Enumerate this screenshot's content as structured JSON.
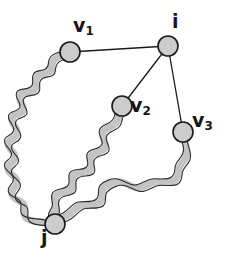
{
  "figure": {
    "background_color": "#ffffff"
  },
  "style": {
    "node_fill": "#cccccc",
    "node_stroke": "#1a1a1a",
    "node_radius": 10,
    "edge_color": "#1a1a1a",
    "edge_width": 1.3,
    "path_fill": "#c4c4c4",
    "path_stroke": "#3a3a3a",
    "path_width": 7
  },
  "nodes": [
    {
      "id": "v1",
      "label": "v",
      "subscript": "1",
      "x": 70,
      "y": 52
    },
    {
      "id": "i",
      "label": "i",
      "subscript": "",
      "x": 168,
      "y": 46
    },
    {
      "id": "v2",
      "label": "v",
      "subscript": "2",
      "x": 122,
      "y": 106
    },
    {
      "id": "v3",
      "label": "v",
      "subscript": "3",
      "x": 183,
      "y": 132
    },
    {
      "id": "j",
      "label": "j",
      "subscript": "",
      "x": 55,
      "y": 224
    }
  ],
  "edges": [
    {
      "from": "i",
      "to": "v1"
    },
    {
      "from": "i",
      "to": "v2"
    },
    {
      "from": "i",
      "to": "v3"
    }
  ],
  "wavy_paths": [
    {
      "id": "path-v1-j",
      "from": "v1",
      "to": "j"
    },
    {
      "id": "path-v2-j",
      "from": "v2",
      "to": "j"
    },
    {
      "id": "path-v3-j",
      "from": "v3",
      "to": "j"
    }
  ],
  "labels": {
    "v1": "v",
    "v1_sub": "1",
    "v2": "v",
    "v2_sub": "2",
    "v3": "v",
    "v3_sub": "3",
    "i": "i",
    "j": "j"
  }
}
